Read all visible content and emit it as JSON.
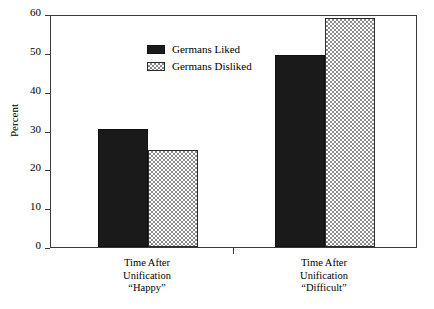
{
  "chart_data": {
    "type": "bar",
    "title": "",
    "subtitle": "",
    "xlabel": "",
    "ylabel": "Percent",
    "ylim": [
      0,
      60
    ],
    "yticks": [
      0,
      10,
      20,
      30,
      40,
      50,
      60
    ],
    "ytick_labels": [
      "0",
      "10",
      "20",
      "30",
      "40",
      "50",
      "60"
    ],
    "grid": false,
    "legend_position": "upper center",
    "categories": [
      "Time After\nUnification\n“Happy”",
      "Time After\nUnification\n“Difficult”"
    ],
    "series": [
      {
        "name": "Germans Liked",
        "fill": "solid-black",
        "color": "#1a1a1a",
        "values": [
          30.5,
          49.5
        ]
      },
      {
        "name": "Germans Disliked",
        "fill": "hatched-gray",
        "color": "#8a8a8a",
        "values": [
          25.0,
          59.0
        ]
      }
    ]
  },
  "axes": {
    "y_title": "Percent"
  },
  "legend": {
    "entries": [
      {
        "label": "Germans Liked",
        "swatch": "solid-black-swatch"
      },
      {
        "label": "Germans Disliked",
        "swatch": "hatched-gray-swatch"
      }
    ]
  },
  "x_axis": {
    "groups": [
      {
        "label": "Time After\nUnification\n“Happy”"
      },
      {
        "label": "Time After\nUnification\n“Difficult”"
      }
    ]
  }
}
